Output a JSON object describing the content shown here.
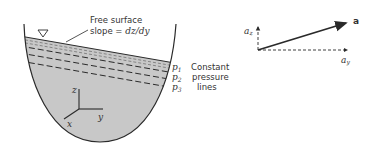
{
  "diagram": {
    "left_panel": {
      "annotation": {
        "line1": "Free surface",
        "line2_prefix": "slope = ",
        "line2_expr": "dz/dy"
      },
      "pressure_labels": [
        {
          "base": "p",
          "sub": "1"
        },
        {
          "base": "p",
          "sub": "2"
        },
        {
          "base": "p",
          "sub": "3"
        }
      ],
      "pressure_caption": [
        "Constant",
        "pressure",
        "lines"
      ],
      "axes": {
        "z": "z",
        "y": "y",
        "x": "x"
      },
      "free_surface_symbol": "triangle-marker"
    },
    "right_panel": {
      "vector_label": "a",
      "az_label": {
        "base": "a",
        "sub": "z"
      },
      "ay_label": {
        "base": "a",
        "sub": "y"
      }
    },
    "colors": {
      "fluid_fill": "#c8c8c8",
      "stroke": "#2a2a2a",
      "text": "#333333"
    }
  }
}
